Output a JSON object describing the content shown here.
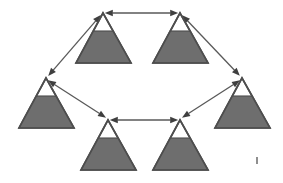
{
  "figure": {
    "background_color": "#ffffff",
    "width": 283,
    "height": 183
  },
  "style": {
    "triangle_outline_color": "#4d4d4d",
    "triangle_fill_color": "#6e6e6e",
    "triangle_empty_color": "#ffffff",
    "arrow_color": "#595959",
    "arrow_head_color": "#3f3f3f"
  },
  "chart_data": {
    "type": "diagram",
    "node_count": 6,
    "edge_count": 6,
    "layout": "hexagonal ring",
    "nodes": [
      {
        "id": "top-left",
        "label": "",
        "shape": "triangle",
        "apex": [
          103,
          13
        ],
        "base_left": [
          76,
          63
        ],
        "base_right": [
          131,
          63
        ],
        "fill_level_ratio": 0.36,
        "fill_color": "#6e6e6e"
      },
      {
        "id": "top-right",
        "label": "",
        "shape": "triangle",
        "apex": [
          180,
          13
        ],
        "base_left": [
          153,
          63
        ],
        "base_right": [
          208,
          63
        ],
        "fill_level_ratio": 0.36,
        "fill_color": "#6e6e6e"
      },
      {
        "id": "middle-left",
        "label": "",
        "shape": "triangle",
        "apex": [
          46,
          78
        ],
        "base_left": [
          19,
          128
        ],
        "base_right": [
          74,
          128
        ],
        "fill_level_ratio": 0.36,
        "fill_color": "#6e6e6e"
      },
      {
        "id": "middle-right",
        "label": "",
        "shape": "triangle",
        "apex": [
          242,
          78
        ],
        "base_left": [
          215,
          128
        ],
        "base_right": [
          270,
          128
        ],
        "fill_level_ratio": 0.36,
        "fill_color": "#6e6e6e"
      },
      {
        "id": "bottom-left",
        "label": "",
        "shape": "triangle",
        "apex": [
          108,
          120
        ],
        "base_left": [
          81,
          170
        ],
        "base_right": [
          136,
          170
        ],
        "fill_level_ratio": 0.36,
        "fill_color": "#6e6e6e"
      },
      {
        "id": "bottom-right",
        "label": "",
        "shape": "triangle",
        "apex": [
          180,
          120
        ],
        "base_left": [
          153,
          170
        ],
        "base_right": [
          208,
          170
        ],
        "fill_level_ratio": 0.36,
        "fill_color": "#6e6e6e"
      }
    ],
    "edges": [
      {
        "id": "edge-top",
        "from": "top-left",
        "to": "top-right",
        "direction": "bidirectional",
        "label": "",
        "start": [
          106,
          13
        ],
        "end": [
          177,
          13
        ]
      },
      {
        "id": "edge-upper-left",
        "from": "top-left",
        "to": "middle-left",
        "direction": "bidirectional",
        "label": "",
        "start": [
          100,
          16
        ],
        "end": [
          49,
          75
        ]
      },
      {
        "id": "edge-upper-right",
        "from": "top-right",
        "to": "middle-right",
        "direction": "bidirectional",
        "label": "",
        "start": [
          183,
          16
        ],
        "end": [
          239,
          75
        ]
      },
      {
        "id": "edge-lower-left",
        "from": "middle-left",
        "to": "bottom-left",
        "direction": "bidirectional",
        "label": "",
        "start": [
          49,
          81
        ],
        "end": [
          105,
          117
        ]
      },
      {
        "id": "edge-lower-right",
        "from": "middle-right",
        "to": "bottom-right",
        "direction": "bidirectional",
        "label": "",
        "start": [
          239,
          81
        ],
        "end": [
          183,
          117
        ]
      },
      {
        "id": "edge-bottom",
        "from": "bottom-left",
        "to": "bottom-right",
        "direction": "bidirectional",
        "label": "",
        "start": [
          111,
          120
        ],
        "end": [
          177,
          120
        ]
      }
    ]
  }
}
